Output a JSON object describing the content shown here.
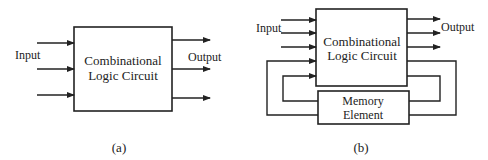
{
  "figure_a": {
    "caption": "(a)",
    "input_label": "Input",
    "output_label": "Output",
    "block": {
      "line1": "Combinational",
      "line2": "Logic Circuit"
    },
    "input_count": 3,
    "output_count": 3
  },
  "figure_b": {
    "caption": "(b)",
    "input_label": "Input",
    "output_label": "Output",
    "block": {
      "line1": "Combinational",
      "line2": "Logic Circuit"
    },
    "memory": {
      "line1": "Memory",
      "line2": "Element"
    },
    "input_count": 3,
    "output_count": 3,
    "feedback_loops": 2
  },
  "colors": {
    "stroke": "#222222",
    "background": "#ffffff"
  }
}
